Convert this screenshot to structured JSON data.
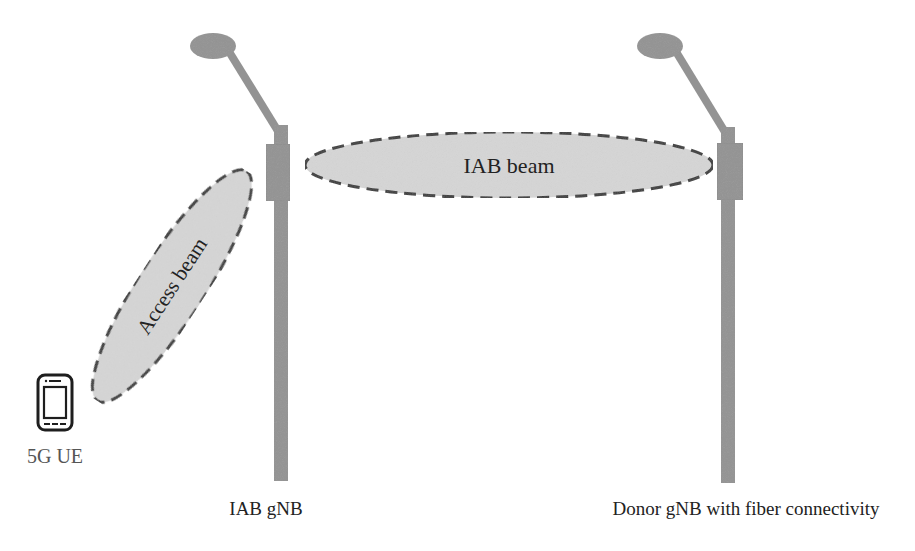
{
  "diagram": {
    "colors": {
      "pole": "#939393",
      "pole_stroke": "#8a8a8a",
      "beam_fill": "#d6d6d6",
      "beam_stroke": "#3a3a3a",
      "text": "#222222",
      "ue_text": "#555555"
    },
    "nodes": {
      "iab_gnb": {
        "label": "IAB gNB"
      },
      "donor_gnb": {
        "label": "Donor gNB with fiber connectivity"
      },
      "ue": {
        "label": "5G UE",
        "icon": "smartphone-icon"
      }
    },
    "beams": {
      "iab_beam": {
        "label": "IAB beam"
      },
      "access_beam": {
        "label": "Access beam"
      }
    }
  }
}
